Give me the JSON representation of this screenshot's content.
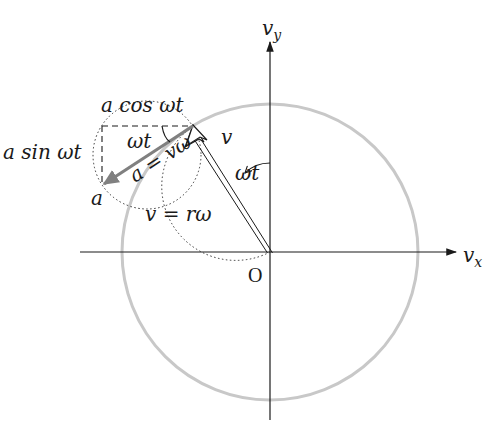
{
  "diagram": {
    "type": "uniform circular motion velocity hodograph",
    "colors": {
      "axis": "#1a1a1a",
      "hodograph_circle": "#c8c8c8",
      "acceleration_vector": "#808080",
      "velocity_vector": "#1a1a1a",
      "dotted_guides": "#333333"
    },
    "axes": {
      "x_label_main": "v",
      "x_label_sub": "x",
      "y_label_main": "v",
      "y_label_sub": "y",
      "origin_label": "O"
    },
    "labels": {
      "velocity": "v",
      "velocity_relation": "v = rω",
      "angle_at_origin": "ωt",
      "angle_at_tip": "ωt",
      "acceleration_relation": "a = vω",
      "acceleration_point": "a",
      "a_cos_component": "a cos ωt",
      "a_sin_component": "a sin ωt"
    }
  }
}
